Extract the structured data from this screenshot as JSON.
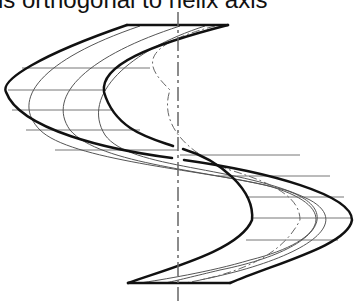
{
  "caption": "is orthogonal to helix axis",
  "diagram": {
    "elements": [
      "outer thick boundary curves",
      "thin intermediate helical curves",
      "dash-dot center helix line",
      "horizontal hatch lines orthogonal to axis",
      "vertical dash-dot helix axis"
    ],
    "colors": {
      "stroke": "#111111",
      "thin": "#555555",
      "hatch": "#777777",
      "axis": "#666666",
      "background": "#ffffff"
    }
  }
}
